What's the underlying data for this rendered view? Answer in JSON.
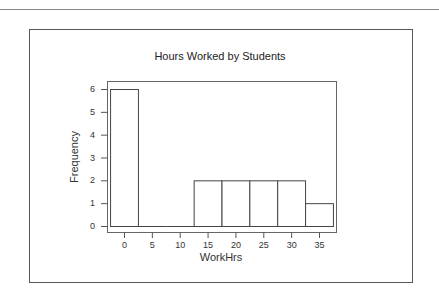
{
  "chart_data": {
    "type": "bar",
    "title": "Hours Worked by Students",
    "xlabel": "WorkHrs",
    "ylabel": "Frequency",
    "bin_width": 5,
    "x": [
      0,
      5,
      10,
      15,
      20,
      25,
      30,
      35
    ],
    "values": [
      6,
      0,
      0,
      2,
      2,
      2,
      2,
      1
    ],
    "xticks": [
      0,
      5,
      10,
      15,
      20,
      25,
      30,
      35
    ],
    "yticks": [
      0,
      1,
      2,
      3,
      4,
      5,
      6
    ],
    "xlim": [
      -3.1,
      38.3
    ],
    "ylim": [
      -0.3,
      6.3
    ],
    "grid": false,
    "legend": "none",
    "colors": {
      "bar_fill": "#ffffff",
      "bar_edge": "#444444",
      "axis": "#555555"
    }
  }
}
